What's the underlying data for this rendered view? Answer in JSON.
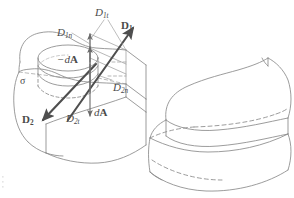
{
  "figure": {
    "domain": "Diagram",
    "background_color": "#ffffff",
    "line_color": "#7f7f7f",
    "heavy_line_color": "#555555",
    "text_color": "#4a4a4a",
    "dash_pattern": "4 3"
  },
  "labels": {
    "d1n": {
      "base": "D",
      "sub": "1n",
      "style": "italic",
      "x": 57,
      "y": 27,
      "size": 11
    },
    "d1t": {
      "base": "D",
      "sub": "1t",
      "style": "italic",
      "x": 95,
      "y": 7,
      "size": 11
    },
    "d1": {
      "base": "D",
      "sub": "1",
      "style": "bold",
      "x": 121,
      "y": 20,
      "size": 11
    },
    "minus_dA": {
      "text": "−d",
      "bold": "A",
      "x": 57,
      "y": 54,
      "size": 11
    },
    "sigma": {
      "text": "σ",
      "x": 20,
      "y": 76,
      "size": 10
    },
    "d2n": {
      "base": "D",
      "sub": "2n",
      "style": "italic",
      "x": 113,
      "y": 82,
      "size": 11
    },
    "d2": {
      "base": "D",
      "sub": "2",
      "style": "bold",
      "x": 22,
      "y": 114,
      "size": 11
    },
    "d2t": {
      "base": "D",
      "sub": "2t",
      "style": "italic",
      "x": 66,
      "y": 113,
      "size": 11
    },
    "dA": {
      "text": "d",
      "bold": "A",
      "x": 94,
      "y": 107,
      "size": 11
    }
  },
  "geometry": {
    "left_figure": {
      "name": "gaussian-pillbox-at-interface",
      "description": "Isometric block of medium with curved free surface, a cylindrical Gaussian pillbox straddling the interface carrying surface charge sigma, and D vectors decomposed into normal and tangential components.",
      "vectors": [
        {
          "name": "D1",
          "from": [
            68,
            120
          ],
          "to": [
            133,
            28
          ],
          "style": "heavy-arrow"
        },
        {
          "name": "D2",
          "from": [
            96,
            64
          ],
          "to": [
            43,
            120
          ],
          "style": "heavy-arrow"
        },
        {
          "name": "D1n",
          "from": [
            90,
            92
          ],
          "to": [
            90,
            34
          ],
          "style": "thin-arrow"
        },
        {
          "name": "D2t",
          "from": [
            90,
            64
          ],
          "to": [
            90,
            116
          ],
          "style": "thin-arrow"
        }
      ]
    },
    "right_figure": {
      "name": "pillbox-solid-3d-view",
      "description": "Plain isometric solid showing the same curved body with the cylindrical pillbox protruding, hidden edges dashed, no annotations."
    }
  },
  "artifact": {
    "name": "scan-speck",
    "x": 2,
    "y": 176
  }
}
